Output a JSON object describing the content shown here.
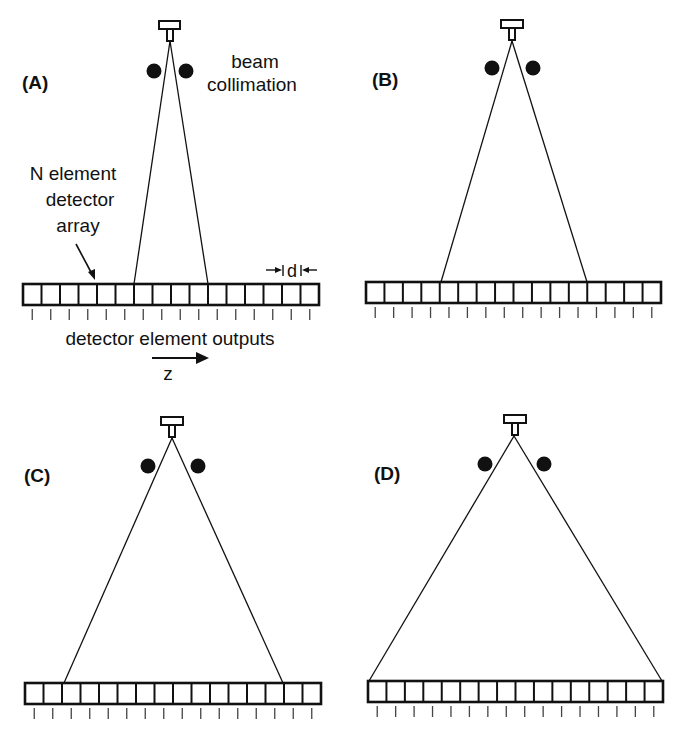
{
  "figure": {
    "colors": {
      "ink": "#111111",
      "background": "#ffffff"
    },
    "annotations": {
      "beam_line1": "beam",
      "beam_line2": "collimation",
      "array_line1": "N element",
      "array_line2": "detector",
      "array_line3": "array",
      "outputs": "detector element outputs",
      "axis": "z",
      "pitch": "d"
    },
    "element_count": 16,
    "panels": [
      {
        "label": "(A)",
        "label_pos": [
          22,
          89
        ],
        "source": {
          "cap": [
            159,
            21,
            21,
            8
          ],
          "stem": [
            167,
            29,
            6,
            12
          ],
          "apex": [
            170,
            41
          ]
        },
        "collimators": [
          [
            154,
            71
          ],
          [
            186,
            71
          ]
        ],
        "beam_ends": [
          [
            134,
            284
          ],
          [
            208,
            284
          ]
        ],
        "array": {
          "x": 23,
          "y": 284,
          "w": 296,
          "h": 21
        }
      },
      {
        "label": "(B)",
        "label_pos": [
          372,
          86
        ],
        "source": {
          "cap": [
            501,
            20,
            22,
            8
          ],
          "stem": [
            509,
            28,
            6,
            12
          ],
          "apex": [
            512,
            41
          ]
        },
        "collimators": [
          [
            492,
            68
          ],
          [
            533,
            68
          ]
        ],
        "beam_ends": [
          [
            441,
            282
          ],
          [
            587,
            282
          ]
        ],
        "array": {
          "x": 366,
          "y": 282,
          "w": 295,
          "h": 21
        }
      },
      {
        "label": "(C)",
        "label_pos": [
          24,
          482
        ],
        "source": {
          "cap": [
            161,
            417,
            22,
            8
          ],
          "stem": [
            169,
            425,
            6,
            12
          ],
          "apex": [
            172,
            438
          ]
        },
        "collimators": [
          [
            148,
            466
          ],
          [
            198,
            466
          ]
        ],
        "beam_ends": [
          [
            64,
            683
          ],
          [
            283,
            683
          ]
        ],
        "array": {
          "x": 25,
          "y": 683,
          "w": 296,
          "h": 21
        }
      },
      {
        "label": "(D)",
        "label_pos": [
          374,
          480
        ],
        "source": {
          "cap": [
            504,
            415,
            22,
            8
          ],
          "stem": [
            512,
            423,
            6,
            12
          ],
          "apex": [
            514,
            436
          ]
        },
        "collimators": [
          [
            485,
            464
          ],
          [
            544,
            464
          ]
        ],
        "beam_ends": [
          [
            369,
            681
          ],
          [
            662,
            681
          ]
        ],
        "array": {
          "x": 368,
          "y": 681,
          "w": 295,
          "h": 21
        }
      }
    ]
  }
}
